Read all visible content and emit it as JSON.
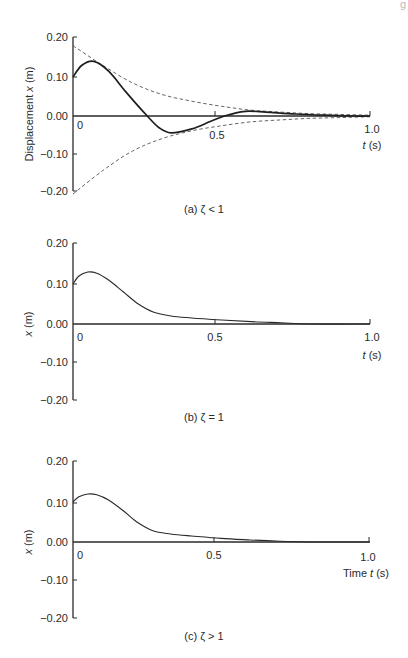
{
  "page_header_fragment": "g",
  "chart_data": [
    {
      "id": "a",
      "type": "line",
      "caption": "(a) ζ < 1",
      "title": "",
      "xlabel": "t (s)",
      "ylabel": "Displacement x (m)",
      "xlim": [
        0,
        1.0
      ],
      "ylim": [
        -0.2,
        0.2
      ],
      "x_ticks": [
        "0",
        "0.5",
        "1.0"
      ],
      "y_ticks": [
        "0.20",
        "0.10",
        "0.00",
        "−0.10",
        "−0.20"
      ],
      "grid": false,
      "legend": null,
      "series": [
        {
          "name": "response",
          "style": "solid-thick",
          "points": [
            [
              0,
              0.1
            ],
            [
              0.03,
              0.13
            ],
            [
              0.07,
              0.14
            ],
            [
              0.12,
              0.115
            ],
            [
              0.18,
              0.06
            ],
            [
              0.25,
              0.0
            ],
            [
              0.29,
              -0.03
            ],
            [
              0.33,
              -0.043
            ],
            [
              0.4,
              -0.033
            ],
            [
              0.46,
              -0.015
            ],
            [
              0.51,
              0.0
            ],
            [
              0.58,
              0.012
            ],
            [
              0.65,
              0.01
            ],
            [
              0.75,
              0.005
            ],
            [
              0.85,
              0.002
            ],
            [
              0.95,
              0.0
            ],
            [
              1.0,
              0.0
            ]
          ]
        },
        {
          "name": "upper envelope",
          "style": "dashed",
          "points": [
            [
              0,
              0.18
            ],
            [
              0.1,
              0.13
            ],
            [
              0.2,
              0.085
            ],
            [
              0.3,
              0.055
            ],
            [
              0.4,
              0.038
            ],
            [
              0.5,
              0.025
            ],
            [
              0.6,
              0.015
            ],
            [
              0.7,
              0.01
            ],
            [
              0.8,
              0.006
            ],
            [
              0.9,
              0.004
            ],
            [
              1.0,
              0.002
            ]
          ]
        },
        {
          "name": "lower envelope",
          "style": "dashed",
          "points": [
            [
              0,
              -0.2
            ],
            [
              0.1,
              -0.14
            ],
            [
              0.2,
              -0.09
            ],
            [
              0.3,
              -0.058
            ],
            [
              0.4,
              -0.038
            ],
            [
              0.5,
              -0.025
            ],
            [
              0.6,
              -0.015
            ],
            [
              0.7,
              -0.01
            ],
            [
              0.8,
              -0.006
            ],
            [
              0.9,
              -0.004
            ],
            [
              1.0,
              -0.002
            ]
          ]
        }
      ]
    },
    {
      "id": "b",
      "type": "line",
      "caption": "(b) ζ = 1",
      "title": "",
      "xlabel": "t (s)",
      "ylabel": "x (m)",
      "xlim": [
        0,
        1.0
      ],
      "ylim": [
        -0.2,
        0.2
      ],
      "x_ticks": [
        "0",
        "0.5",
        "1.0"
      ],
      "y_ticks": [
        "0.20",
        "0.10",
        "0.00",
        "−0.10",
        "−0.20"
      ],
      "grid": false,
      "legend": null,
      "series": [
        {
          "name": "response",
          "style": "solid-thin",
          "points": [
            [
              0,
              0.1
            ],
            [
              0.02,
              0.12
            ],
            [
              0.05,
              0.13
            ],
            [
              0.08,
              0.127
            ],
            [
              0.12,
              0.11
            ],
            [
              0.17,
              0.08
            ],
            [
              0.22,
              0.05
            ],
            [
              0.27,
              0.03
            ],
            [
              0.33,
              0.02
            ],
            [
              0.4,
              0.015
            ],
            [
              0.5,
              0.01
            ],
            [
              0.6,
              0.006
            ],
            [
              0.7,
              0.003
            ],
            [
              0.8,
              0.0
            ],
            [
              1.0,
              0.0
            ]
          ]
        }
      ]
    },
    {
      "id": "c",
      "type": "line",
      "caption": "(c) ζ > 1",
      "title": "",
      "xlabel": "Time t (s)",
      "ylabel": "x (m)",
      "xlim": [
        0,
        1.0
      ],
      "ylim": [
        -0.2,
        0.2
      ],
      "x_ticks": [
        "0",
        "0.5",
        "1.0"
      ],
      "y_ticks": [
        "0.20",
        "0.10",
        "0.00",
        "−0.10",
        "−0.20"
      ],
      "grid": false,
      "legend": null,
      "series": [
        {
          "name": "response",
          "style": "solid-thin",
          "points": [
            [
              0,
              0.1
            ],
            [
              0.02,
              0.113
            ],
            [
              0.05,
              0.12
            ],
            [
              0.08,
              0.118
            ],
            [
              0.12,
              0.105
            ],
            [
              0.17,
              0.078
            ],
            [
              0.22,
              0.048
            ],
            [
              0.27,
              0.028
            ],
            [
              0.33,
              0.02
            ],
            [
              0.4,
              0.015
            ],
            [
              0.5,
              0.009
            ],
            [
              0.6,
              0.005
            ],
            [
              0.7,
              0.002
            ],
            [
              0.8,
              0.0
            ],
            [
              1.0,
              0.0
            ]
          ]
        }
      ]
    }
  ],
  "panels": {
    "a": {
      "ylabel_prefix": "Displacement ",
      "ylabel_var": "x",
      "ylabel_suffix": " (m)",
      "xlabel_var": "t",
      "xlabel_suffix": " (s)",
      "caption": "(a) ζ < 1"
    },
    "b": {
      "ylabel_var": "x",
      "ylabel_suffix": " (m)",
      "xlabel_var": "t",
      "xlabel_suffix": " (s)",
      "caption": "(b) ζ = 1"
    },
    "c": {
      "ylabel_var": "x",
      "ylabel_suffix": " (m)",
      "xlabel_prefix": "Time ",
      "xlabel_var": "t",
      "xlabel_suffix": " (s)",
      "caption": "(c) ζ > 1"
    }
  },
  "ticks": {
    "y": [
      "0.20",
      "0.10",
      "0.00",
      "−0.10",
      "−0.20"
    ],
    "x0": "0",
    "x_mid": "0.5",
    "x_end": "1.0"
  }
}
